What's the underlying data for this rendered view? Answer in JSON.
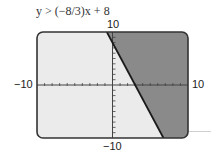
{
  "chart_data": {
    "type": "area",
    "title": "y > (−8/3)x + 8",
    "inequality": {
      "slope": -2.6667,
      "intercept": 8,
      "operator": ">"
    },
    "xlim": [
      -10,
      10
    ],
    "ylim": [
      -10,
      10
    ],
    "x_tick_labels": {
      "min": "−10",
      "max": "10"
    },
    "y_tick_labels": {
      "min": "−10",
      "max": "10"
    },
    "tick_spacing": 1,
    "boundary_line": {
      "style": "solid",
      "points": [
        [
          0.75,
          10
        ],
        [
          6.75,
          -10
        ]
      ]
    },
    "shaded_region": "right of / above the line",
    "grid": false,
    "legend": null
  },
  "labels": {
    "title": "y > (−8/3)x + 8",
    "x_min": "−10",
    "x_max": "10",
    "y_min": "−10",
    "y_max": "10"
  },
  "colors": {
    "background_panel": "#ebebeb",
    "shaded": "#8a8a8a",
    "line": "#1a1a1a",
    "frame": "#333333"
  }
}
